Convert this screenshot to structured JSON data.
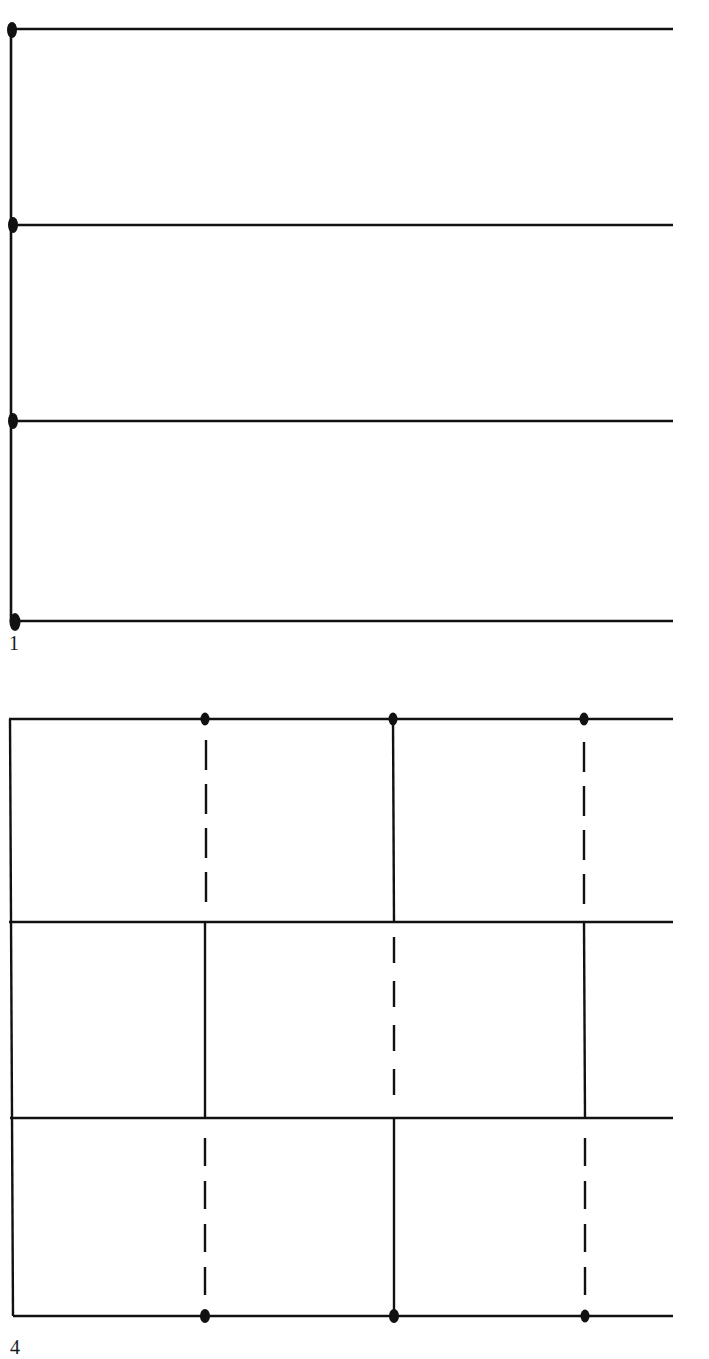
{
  "figures": [
    {
      "label": "1",
      "description": "Four horizontal lines joined by a vertical line on the left, with a dot at each junction",
      "left_line": {
        "x": 11,
        "y_start": 28,
        "y_end": 622
      },
      "horizontal_lines": [
        {
          "y": 29,
          "x_start": 11,
          "x_end": 673,
          "left_dot": true
        },
        {
          "y": 225,
          "x_start": 11,
          "x_end": 673,
          "left_dot": true
        },
        {
          "y": 421,
          "x_start": 11,
          "x_end": 673,
          "left_dot": true
        },
        {
          "y": 621,
          "x_start": 11,
          "x_end": 673,
          "left_dot": true
        }
      ]
    },
    {
      "label": "4",
      "description": "Four horizontal lines with a left border and three vertical columns alternating solid and dashed segments per row; dots on top and bottom lines at each column",
      "left_line": {
        "x": 12,
        "y_start": 720,
        "y_end": 1316
      },
      "horizontal_lines": [
        {
          "y": 719,
          "x_start": 9,
          "x_end": 673
        },
        {
          "y": 922,
          "x_start": 9,
          "x_end": 673
        },
        {
          "y": 1118,
          "x_start": 10,
          "x_end": 673
        },
        {
          "y": 1316,
          "x_start": 13,
          "x_end": 673
        }
      ],
      "columns": [
        {
          "x": 205,
          "segments": [
            "dashed",
            "solid",
            "dashed"
          ],
          "top_dot": true,
          "bottom_dot": true
        },
        {
          "x": 393,
          "segments": [
            "solid",
            "dashed",
            "solid"
          ],
          "top_dot": true,
          "bottom_dot": true
        },
        {
          "x": 584,
          "segments": [
            "dashed",
            "solid",
            "dashed"
          ],
          "top_dot": true,
          "bottom_dot": true
        }
      ]
    }
  ],
  "style": {
    "line_color": "#111111",
    "background": "#ffffff"
  }
}
